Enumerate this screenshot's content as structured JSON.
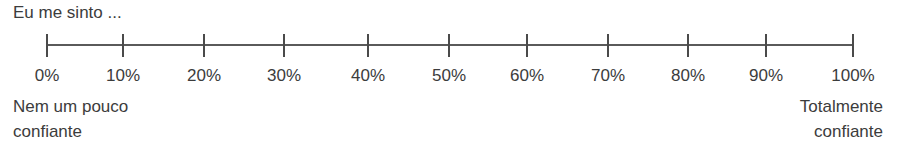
{
  "prompt": "Eu me sinto ...",
  "scale": {
    "ticks": [
      {
        "label": "0%",
        "x": 47
      },
      {
        "label": "10%",
        "x": 123
      },
      {
        "label": "20%",
        "x": 204
      },
      {
        "label": "30%",
        "x": 284
      },
      {
        "label": "40%",
        "x": 368
      },
      {
        "label": "50%",
        "x": 449
      },
      {
        "label": "60%",
        "x": 527
      },
      {
        "label": "70%",
        "x": 608
      },
      {
        "label": "80%",
        "x": 688
      },
      {
        "label": "90%",
        "x": 766
      },
      {
        "label": "100%",
        "x": 853
      }
    ],
    "left_anchor": {
      "line1": "Nem um pouco",
      "line2": "confiante"
    },
    "right_anchor": {
      "line1": "Totalmente",
      "line2": "confiante"
    }
  }
}
